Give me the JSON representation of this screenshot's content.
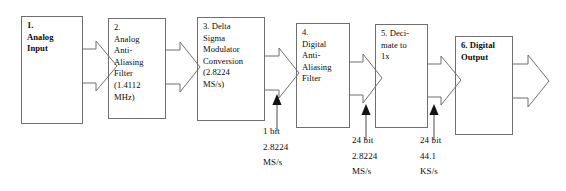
{
  "diagram": {
    "type": "block-flow",
    "stroke_color": "#6f6f6f",
    "arrow_color": "#4a4a4a",
    "text_color": "#0b0b0b",
    "blocks": [
      {
        "id": "block-1",
        "name": "analog-input-block",
        "label": "1.\nAnalog\nInput",
        "bold": true,
        "x": 21,
        "y": 16,
        "w": 62,
        "h": 108
      },
      {
        "id": "block-2",
        "name": "analog-anti-aliasing-filter-block",
        "label": "2.\nAnalog\nAnti-\nAliasing\nFilter\n(1.4112\nMHz)",
        "bold": false,
        "x": 108,
        "y": 18,
        "w": 58,
        "h": 101
      },
      {
        "id": "block-3",
        "name": "delta-sigma-modulator-block",
        "label": "3. Delta\nSigma\nModulator\nConversion\n(2.8224\nMS/s)",
        "bold": false,
        "x": 197,
        "y": 17,
        "w": 68,
        "h": 104
      },
      {
        "id": "block-4",
        "name": "digital-anti-aliasing-filter-block",
        "label": "4.\nDigital\nAnti-\nAliasing\nFilter",
        "bold": false,
        "x": 296,
        "y": 23,
        "w": 54,
        "h": 105
      },
      {
        "id": "block-5",
        "name": "decimate-block",
        "label": "5. Deci-\nmate to\n1x",
        "bold": false,
        "x": 375,
        "y": 24,
        "w": 53,
        "h": 104
      },
      {
        "id": "block-6",
        "name": "digital-output-block",
        "label": "6. Digital\nOutput",
        "bold": true,
        "x": 455,
        "y": 36,
        "w": 58,
        "h": 99
      }
    ],
    "signal_annotations": [
      {
        "id": "annot-1",
        "name": "signal-annotation-1bit",
        "label": "1 bit\n2.8224\nMS/s",
        "x": 263,
        "y": 124,
        "arrow_x": 277,
        "arrow_y_tail": 130,
        "arrow_y_tip": 96
      },
      {
        "id": "annot-2",
        "name": "signal-annotation-24bit-28224",
        "label": "24 bit\n2.8224\nMS/s",
        "x": 352,
        "y": 133,
        "arrow_x": 366,
        "arrow_y_tail": 139,
        "arrow_y_tip": 106
      },
      {
        "id": "annot-3",
        "name": "signal-annotation-24bit-441",
        "label": "24 bit\n44.1\nKS/s",
        "x": 420,
        "y": 133,
        "arrow_x": 434,
        "arrow_y_tail": 139,
        "arrow_y_tip": 106
      }
    ],
    "flow_arrows": [
      {
        "id": "flow-1",
        "name": "flow-arrow-1-to-2",
        "from": "block-1",
        "to": "block-2",
        "x": 83,
        "cy": 66
      },
      {
        "id": "flow-2",
        "name": "flow-arrow-2-to-3",
        "from": "block-2",
        "to": "block-3",
        "x": 166,
        "cy": 67
      },
      {
        "id": "flow-3",
        "name": "flow-arrow-3-to-4",
        "from": "block-3",
        "to": "block-4",
        "x": 265,
        "cy": 73
      },
      {
        "id": "flow-4",
        "name": "flow-arrow-4-to-5",
        "from": "block-4",
        "to": "block-5",
        "x": 350,
        "cy": 78
      },
      {
        "id": "flow-5",
        "name": "flow-arrow-5-to-6",
        "from": "block-5",
        "to": "block-6",
        "x": 428,
        "cy": 80
      },
      {
        "id": "flow-6",
        "name": "flow-arrow-output",
        "from": "block-6",
        "to": "output",
        "x": 513,
        "cy": 82
      }
    ]
  }
}
